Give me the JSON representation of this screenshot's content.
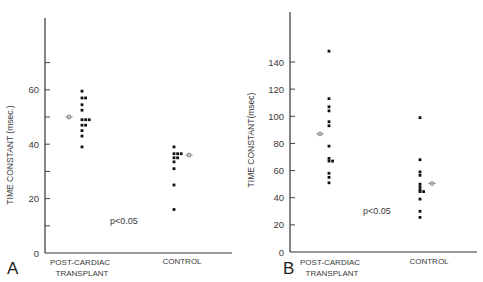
{
  "chart_data": [
    {
      "panel": "A",
      "type": "scatter",
      "ylabel": "TIME CONSTANT (msec.)",
      "xlabel": "",
      "categories": [
        "POST-CARDIAC TRANSPLANT",
        "CONTROL"
      ],
      "yticks_labeled": [
        0,
        20,
        40,
        60
      ],
      "yticks_minor": [
        10,
        30,
        50,
        70
      ],
      "ylim": [
        0,
        70
      ],
      "annotation": "p<0.05",
      "series": [
        {
          "name": "POST-CARDIAC TRANSPLANT",
          "values": [
            59.5,
            57,
            57,
            54.5,
            52.5,
            49,
            49,
            49,
            47,
            47,
            45,
            43,
            39
          ],
          "mean": 50
        },
        {
          "name": "CONTROL",
          "values": [
            39,
            36.5,
            36.5,
            36.5,
            35,
            35,
            33.5,
            31,
            25,
            16
          ],
          "mean": 36
        }
      ]
    },
    {
      "panel": "B",
      "type": "scatter",
      "ylabel": "TIME CONSTANT(msec)",
      "xlabel": "",
      "categories": [
        "POST-CARDIAC TRANSPLANT",
        "CONTROL"
      ],
      "yticks_labeled": [
        0,
        20,
        40,
        60,
        80,
        100,
        120,
        140
      ],
      "ylim": [
        0,
        160
      ],
      "annotation": "p<0.05",
      "series": [
        {
          "name": "POST-CARDIAC TRANSPLANT",
          "values": [
            148,
            113,
            107,
            104,
            96,
            93,
            78,
            69,
            67,
            67,
            58,
            55,
            51
          ],
          "mean": 87
        },
        {
          "name": "CONTROL",
          "values": [
            99,
            68,
            59,
            56.5,
            50,
            48,
            46,
            44.5,
            44.5,
            39,
            30,
            25.5
          ],
          "mean": 50.5
        }
      ]
    }
  ],
  "panels": {
    "A": {
      "letter": "A",
      "ylabel": "TIME CONSTANT (msec.)",
      "xcat1_line1": "POST-CARDIAC",
      "xcat1_line2": "TRANSPLANT",
      "xcat2": "CONTROL",
      "pvalue": "p<0.05"
    },
    "B": {
      "letter": "B",
      "ylabel": "TIME CONSTANT(msec)",
      "xcat1_line1": "POST-CARDIAC",
      "xcat1_line2": "TRANSPLANT",
      "xcat2": "CONTROL",
      "pvalue": "p<0.05"
    }
  }
}
